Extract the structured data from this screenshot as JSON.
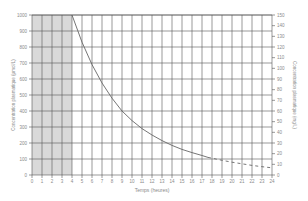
{
  "chart_data": {
    "type": "line",
    "title": "",
    "xlabel": "Temps (heures)",
    "ylabel": "Concentration plasmatique (µmol/L)",
    "ylabel_right": "Concentration plasmatique (mg/L)",
    "xlim": [
      0,
      24
    ],
    "ylim": [
      0,
      1000
    ],
    "ylim_right": [
      0,
      150
    ],
    "grid": true,
    "legend": null,
    "x_ticks": [
      0,
      1,
      2,
      3,
      4,
      5,
      6,
      7,
      8,
      9,
      10,
      11,
      12,
      13,
      14,
      15,
      16,
      17,
      18,
      19,
      20,
      21,
      22,
      23,
      24
    ],
    "y_ticks": [
      0,
      100,
      200,
      300,
      400,
      500,
      600,
      700,
      800,
      900,
      1000
    ],
    "y_ticks_right": [
      0,
      10,
      20,
      30,
      40,
      50,
      60,
      70,
      80,
      90,
      100,
      110,
      120,
      130,
      140,
      150
    ],
    "shaded_region": {
      "x_from": 0,
      "x_to": 4,
      "color": "#d9d9d9"
    },
    "series": [
      {
        "name": "measured",
        "style": "solid",
        "x": [
          4,
          5,
          6,
          7,
          8,
          9,
          10,
          11,
          12,
          13,
          14,
          15,
          16,
          17,
          17.6
        ],
        "y": [
          1000,
          830,
          690,
          575,
          480,
          400,
          340,
          290,
          250,
          215,
          185,
          160,
          140,
          122,
          110
        ]
      },
      {
        "name": "extrapolated",
        "style": "dashed",
        "x": [
          17.6,
          18,
          19,
          20,
          21,
          22,
          23,
          24
        ],
        "y": [
          110,
          105,
          92,
          80,
          70,
          60,
          52,
          45
        ]
      }
    ]
  },
  "colors": {
    "grid": "#555555",
    "curve": "#666666",
    "shade": "#d9d9d9",
    "text": "#8a8a8a"
  }
}
